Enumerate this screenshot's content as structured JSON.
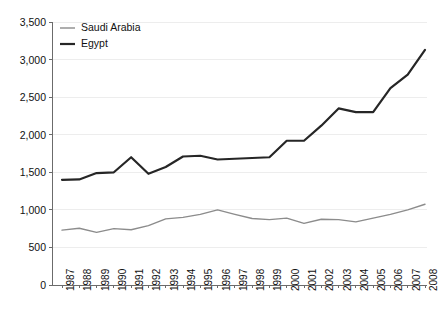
{
  "chart_data": {
    "type": "line",
    "title": "",
    "subtitle": "",
    "xlabel": "",
    "ylabel": "",
    "grid": true,
    "legend_position": "top-left",
    "xlim": [
      1987,
      2008
    ],
    "ylim": [
      0,
      3500
    ],
    "ytick_values": [
      0,
      500,
      1000,
      1500,
      2000,
      2500,
      3000,
      3500
    ],
    "ytick_labels": [
      "0",
      "500",
      "1,000",
      "1,500",
      "2,000",
      "2,500",
      "3,000",
      "3,500"
    ],
    "categories": [
      "1987",
      "1988",
      "1989",
      "1990",
      "1991",
      "1992",
      "1993",
      "1994",
      "1995",
      "1996",
      "1997",
      "1998",
      "1999",
      "2000",
      "2001",
      "2002",
      "2003",
      "2004",
      "2005",
      "2006",
      "2007",
      "2008"
    ],
    "x": [
      1987,
      1988,
      1989,
      1990,
      1991,
      1992,
      1993,
      1994,
      1995,
      1996,
      1997,
      1998,
      1999,
      2000,
      2001,
      2002,
      2003,
      2004,
      2005,
      2006,
      2007,
      2008
    ],
    "series": [
      {
        "name": "Saudi Arabia",
        "color": "#8c8c8c",
        "width": 1.4,
        "values": [
          730,
          755,
          700,
          750,
          735,
          790,
          880,
          900,
          940,
          1000,
          940,
          885,
          870,
          890,
          820,
          875,
          870,
          840,
          890,
          940,
          1000,
          1075
        ]
      },
      {
        "name": "Egypt",
        "color": "#262626",
        "width": 2.2,
        "values": [
          1400,
          1405,
          1490,
          1500,
          1700,
          1480,
          1570,
          1710,
          1720,
          1670,
          1680,
          1690,
          1700,
          1920,
          1920,
          2120,
          2350,
          2300,
          2300,
          2620,
          2800,
          3130
        ]
      }
    ]
  },
  "legend": {
    "items": [
      {
        "label": "Saudi Arabia"
      },
      {
        "label": "Egypt"
      }
    ]
  },
  "axes": {
    "y_max_label": "3,500",
    "y_min_label": "0"
  }
}
